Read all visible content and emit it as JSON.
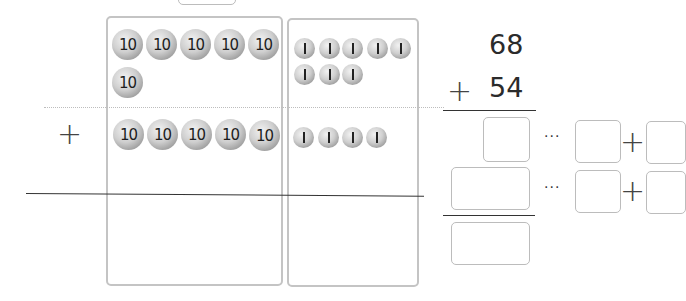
{
  "problem": {
    "addend1": "68",
    "addend2": "54",
    "operator": "+"
  },
  "model": {
    "tens_label": "10",
    "ones_label": "1",
    "top_tens_count": 6,
    "top_ones_count": 8,
    "bottom_tens_count": 5,
    "bottom_ones_count": 4,
    "row_operator": "+"
  },
  "work": {
    "ellipsis": "···",
    "plus": "+",
    "answer_boxes": [
      {
        "row": "ones",
        "value": ""
      },
      {
        "row": "tens",
        "value": ""
      },
      {
        "row": "sum",
        "value": ""
      }
    ],
    "split_boxes": [
      {
        "row": 1,
        "left": "",
        "right": ""
      },
      {
        "row": 2,
        "left": "",
        "right": ""
      }
    ]
  }
}
